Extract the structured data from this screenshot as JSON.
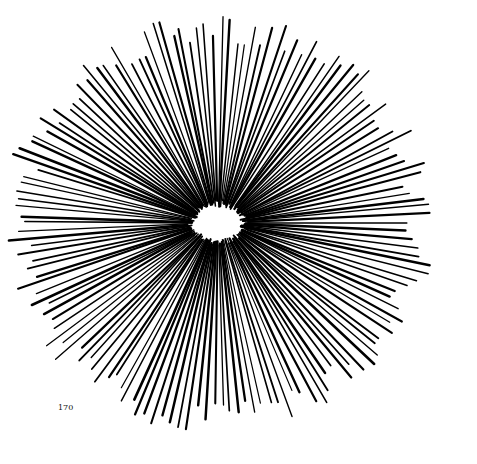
{
  "page": {
    "page_number": "170"
  },
  "figure": {
    "center": [
      218,
      223
    ],
    "ellipse": {
      "rx": 20,
      "ry": 11
    },
    "line_count": 150,
    "inner_radius": 22,
    "outer_radius_min": 185,
    "outer_radius_max": 218,
    "line_color": "#000000",
    "background_color": "#ffffff"
  }
}
